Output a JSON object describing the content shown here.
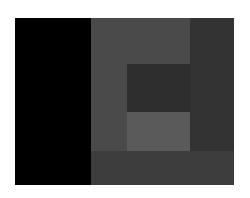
{
  "canvas": {
    "width": 250,
    "height": 198,
    "background": "#ffffff"
  },
  "blocks": [
    {
      "name": "black-column",
      "x": 15,
      "y": 18,
      "w": 76,
      "h": 167,
      "color": "#000000"
    },
    {
      "name": "mid-gray-field",
      "x": 91,
      "y": 18,
      "w": 99,
      "h": 133,
      "color": "#4a4a4a"
    },
    {
      "name": "dark-right-column",
      "x": 190,
      "y": 18,
      "w": 44,
      "h": 133,
      "color": "#333333"
    },
    {
      "name": "dark-inner-square",
      "x": 127,
      "y": 64,
      "w": 63,
      "h": 48,
      "color": "#2e2e2e"
    },
    {
      "name": "light-inner-square",
      "x": 127,
      "y": 112,
      "w": 63,
      "h": 39,
      "color": "#5a5a5a"
    },
    {
      "name": "bottom-band",
      "x": 91,
      "y": 151,
      "w": 143,
      "h": 34,
      "color": "#3d3d3d"
    }
  ]
}
